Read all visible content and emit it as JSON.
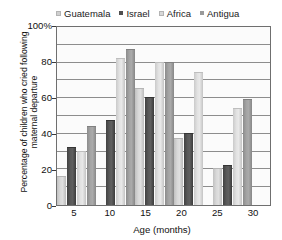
{
  "chart_data": {
    "type": "bar",
    "title": "",
    "subtitle": "",
    "xlabel": "Age (months)",
    "ylabel": "Percentage of children who cried following maternal departure",
    "categories": [
      "5",
      "10",
      "15",
      "20",
      "25",
      "30"
    ],
    "ylim": [
      0,
      100
    ],
    "ytick_labels": [
      "0",
      "20",
      "40",
      "60",
      "80",
      "100%"
    ],
    "ytick_values": [
      0,
      20,
      40,
      60,
      80,
      100
    ],
    "grid": true,
    "grid_interval": 10,
    "legend_position": "top",
    "series": [
      {
        "name": "Guatemala",
        "color": "#cfcfcf",
        "values": [
          16,
          null,
          65,
          37,
          20,
          null
        ]
      },
      {
        "name": "Israel",
        "color": "#4f4f4f",
        "values": [
          32,
          47,
          60,
          40,
          22,
          null
        ]
      },
      {
        "name": "Africa",
        "color": "#d8d8d8",
        "values": [
          30,
          82,
          80,
          74,
          54,
          null
        ]
      },
      {
        "name": "Antigua",
        "color": "#9a9a9a",
        "values": [
          44,
          87,
          80,
          null,
          59,
          32
        ]
      }
    ]
  },
  "legend": {
    "items": [
      {
        "label": "Guatemala",
        "marker": "square-swatch"
      },
      {
        "label": "Israel",
        "marker": "square-swatch"
      },
      {
        "label": "Africa",
        "marker": "square-swatch"
      },
      {
        "label": "Antigua",
        "marker": "square-swatch"
      }
    ]
  },
  "colors": {
    "axis": "#6f6f6f",
    "grid": "#8d8d8d",
    "plot_background": "#fbfbfb",
    "page_background": "#ffffff",
    "text": "#111111"
  }
}
